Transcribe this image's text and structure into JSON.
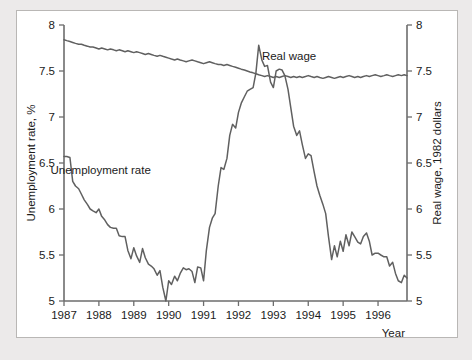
{
  "chart_data": {
    "type": "line",
    "title": "",
    "xlabel": "Year",
    "ylabel_left": "Unemployment rate, %",
    "ylabel_right": "Real wage, 1982 dollars",
    "xlim": [
      1987,
      1996.83
    ],
    "ylim": [
      5,
      8
    ],
    "grid": false,
    "x_ticks": [
      1987,
      1988,
      1989,
      1990,
      1991,
      1992,
      1993,
      1994,
      1995,
      1996
    ],
    "x_tick_labels": [
      "1987",
      "1988",
      "1989",
      "1990",
      "1991",
      "1992",
      "1993",
      "1994",
      "1995",
      "1996"
    ],
    "y_ticks_left": [
      5,
      5.5,
      6,
      6.5,
      7,
      7.5,
      8
    ],
    "y_tick_labels_left": [
      "5",
      "5.5",
      "6",
      "6.5",
      "7",
      "7.5",
      "8"
    ],
    "y_ticks_right": [
      5,
      5.5,
      6,
      6.5,
      7,
      7.5,
      8
    ],
    "y_tick_labels_right": [
      "5",
      "5.5",
      "6",
      "6.5",
      "7",
      "7.5",
      "8"
    ],
    "annotations": [
      {
        "text": "Real wage",
        "x": 1993.45,
        "y": 7.62
      },
      {
        "text": "Unemployment rate",
        "x": 1988.05,
        "y": 6.38
      }
    ],
    "series": [
      {
        "name": "Real wage",
        "axis": "right",
        "color": "#606060",
        "x": [
          1987.0,
          1987.08,
          1987.17,
          1987.25,
          1987.33,
          1987.42,
          1987.5,
          1987.58,
          1987.67,
          1987.75,
          1987.83,
          1987.92,
          1988.0,
          1988.08,
          1988.17,
          1988.25,
          1988.33,
          1988.42,
          1988.5,
          1988.58,
          1988.67,
          1988.75,
          1988.83,
          1988.92,
          1989.0,
          1989.08,
          1989.17,
          1989.25,
          1989.33,
          1989.42,
          1989.5,
          1989.58,
          1989.67,
          1989.75,
          1989.83,
          1989.92,
          1990.0,
          1990.08,
          1990.17,
          1990.25,
          1990.33,
          1990.42,
          1990.5,
          1990.58,
          1990.67,
          1990.75,
          1990.83,
          1990.92,
          1991.0,
          1991.08,
          1991.17,
          1991.25,
          1991.33,
          1991.42,
          1991.5,
          1991.58,
          1991.67,
          1991.75,
          1991.83,
          1991.92,
          1992.0,
          1992.08,
          1992.17,
          1992.25,
          1992.33,
          1992.42,
          1992.5,
          1992.58,
          1992.67,
          1992.75,
          1992.83,
          1992.92,
          1993.0,
          1993.08,
          1993.17,
          1993.25,
          1993.33,
          1993.42,
          1993.5,
          1993.58,
          1993.67,
          1993.75,
          1993.83,
          1993.92,
          1994.0,
          1994.08,
          1994.17,
          1994.25,
          1994.33,
          1994.42,
          1994.5,
          1994.58,
          1994.67,
          1994.75,
          1994.83,
          1994.92,
          1995.0,
          1995.08,
          1995.17,
          1995.25,
          1995.33,
          1995.42,
          1995.5,
          1995.58,
          1995.67,
          1995.75,
          1995.83,
          1995.92,
          1996.0,
          1996.08,
          1996.17,
          1996.25,
          1996.33,
          1996.42,
          1996.5,
          1996.58,
          1996.67,
          1996.75,
          1996.83
        ],
        "values": [
          7.84,
          7.83,
          7.82,
          7.81,
          7.8,
          7.79,
          7.79,
          7.78,
          7.77,
          7.76,
          7.76,
          7.75,
          7.74,
          7.75,
          7.74,
          7.73,
          7.74,
          7.73,
          7.72,
          7.73,
          7.72,
          7.71,
          7.72,
          7.71,
          7.7,
          7.71,
          7.7,
          7.69,
          7.68,
          7.69,
          7.68,
          7.67,
          7.66,
          7.67,
          7.66,
          7.65,
          7.64,
          7.63,
          7.62,
          7.63,
          7.62,
          7.61,
          7.6,
          7.61,
          7.62,
          7.61,
          7.6,
          7.59,
          7.58,
          7.59,
          7.6,
          7.59,
          7.58,
          7.57,
          7.57,
          7.56,
          7.57,
          7.56,
          7.55,
          7.54,
          7.53,
          7.52,
          7.51,
          7.5,
          7.49,
          7.48,
          7.47,
          7.46,
          7.45,
          7.44,
          7.45,
          7.44,
          7.43,
          7.44,
          7.43,
          7.44,
          7.45,
          7.44,
          7.43,
          7.44,
          7.43,
          7.44,
          7.43,
          7.44,
          7.45,
          7.44,
          7.43,
          7.44,
          7.43,
          7.42,
          7.43,
          7.44,
          7.43,
          7.42,
          7.43,
          7.44,
          7.43,
          7.44,
          7.45,
          7.44,
          7.43,
          7.44,
          7.43,
          7.44,
          7.45,
          7.44,
          7.45,
          7.46,
          7.45,
          7.44,
          7.45,
          7.46,
          7.45,
          7.44,
          7.45,
          7.46,
          7.45,
          7.46,
          7.45
        ]
      },
      {
        "name": "Unemployment rate",
        "axis": "left",
        "color": "#606060",
        "x": [
          1987.0,
          1987.08,
          1987.17,
          1987.25,
          1987.33,
          1987.42,
          1987.5,
          1987.58,
          1987.67,
          1987.75,
          1987.83,
          1987.92,
          1988.0,
          1988.08,
          1988.17,
          1988.25,
          1988.33,
          1988.42,
          1988.5,
          1988.58,
          1988.67,
          1988.75,
          1988.83,
          1988.92,
          1989.0,
          1989.08,
          1989.17,
          1989.25,
          1989.33,
          1989.42,
          1989.5,
          1989.58,
          1989.67,
          1989.75,
          1989.83,
          1989.92,
          1990.0,
          1990.08,
          1990.17,
          1990.25,
          1990.33,
          1990.42,
          1990.5,
          1990.58,
          1990.67,
          1990.75,
          1990.83,
          1990.92,
          1991.0,
          1991.08,
          1991.17,
          1991.25,
          1991.33,
          1991.42,
          1991.5,
          1991.58,
          1991.67,
          1991.75,
          1991.83,
          1991.92,
          1992.0,
          1992.08,
          1992.17,
          1992.25,
          1992.33,
          1992.42,
          1992.5,
          1992.58,
          1992.67,
          1992.75,
          1992.83,
          1992.92,
          1993.0,
          1993.08,
          1993.17,
          1993.25,
          1993.33,
          1993.42,
          1993.5,
          1993.58,
          1993.67,
          1993.75,
          1993.83,
          1993.92,
          1994.0,
          1994.08,
          1994.17,
          1994.25,
          1994.33,
          1994.42,
          1994.5,
          1994.58,
          1994.67,
          1994.75,
          1994.83,
          1994.92,
          1995.0,
          1995.08,
          1995.17,
          1995.25,
          1995.33,
          1995.42,
          1995.5,
          1995.58,
          1995.67,
          1995.75,
          1995.83,
          1995.92,
          1996.0,
          1996.08,
          1996.17,
          1996.25,
          1996.33,
          1996.42,
          1996.5,
          1996.58,
          1996.67,
          1996.75,
          1996.83
        ],
        "values": [
          6.57,
          6.57,
          6.56,
          6.3,
          6.25,
          6.22,
          6.16,
          6.1,
          6.05,
          6.0,
          5.98,
          5.96,
          6.0,
          5.92,
          5.88,
          5.83,
          5.8,
          5.79,
          5.79,
          5.71,
          5.7,
          5.7,
          5.55,
          5.46,
          5.58,
          5.49,
          5.42,
          5.57,
          5.47,
          5.4,
          5.38,
          5.35,
          5.28,
          5.33,
          5.15,
          5.0,
          5.22,
          5.18,
          5.27,
          5.22,
          5.3,
          5.36,
          5.34,
          5.35,
          5.32,
          5.2,
          5.37,
          5.36,
          5.22,
          5.55,
          5.8,
          5.9,
          5.95,
          6.25,
          6.45,
          6.43,
          6.55,
          6.8,
          6.92,
          6.88,
          7.05,
          7.15,
          7.22,
          7.28,
          7.3,
          7.32,
          7.48,
          7.78,
          7.62,
          7.55,
          7.56,
          7.38,
          7.32,
          7.5,
          7.52,
          7.51,
          7.45,
          7.3,
          7.1,
          6.9,
          6.8,
          6.85,
          6.7,
          6.55,
          6.6,
          6.58,
          6.4,
          6.25,
          6.15,
          6.05,
          5.95,
          5.7,
          5.45,
          5.6,
          5.48,
          5.65,
          5.54,
          5.72,
          5.6,
          5.75,
          5.7,
          5.64,
          5.62,
          5.7,
          5.74,
          5.65,
          5.5,
          5.52,
          5.52,
          5.5,
          5.48,
          5.48,
          5.38,
          5.42,
          5.3,
          5.22,
          5.2,
          5.28,
          5.25
        ]
      }
    ]
  }
}
